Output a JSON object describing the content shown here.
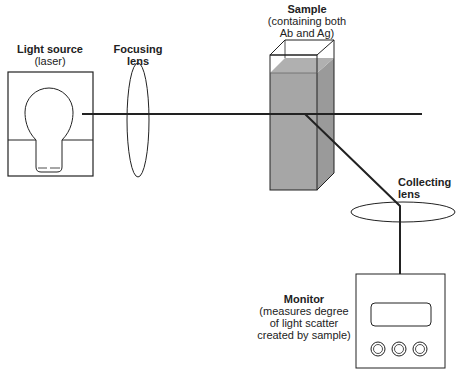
{
  "diagram": {
    "type": "light-scatter-nephelometry-setup",
    "labels": {
      "light_source": {
        "title": "Light source",
        "subtitle": "(laser)"
      },
      "focusing_lens": {
        "title": "Focusing",
        "title2": "lens"
      },
      "sample": {
        "title": "Sample",
        "sub1": "(containing both",
        "sub2": "Ab and Ag)"
      },
      "collecting_lens": {
        "title": "Collecting",
        "title2": "lens"
      },
      "monitor": {
        "title": "Monitor",
        "sub1": "(measures degree",
        "sub2": "of light scatter",
        "sub3": "created by sample)"
      }
    },
    "colors": {
      "line": "#222222",
      "sample_fill": "#a6a6a6",
      "sample_side_fill": "#9a9a9a",
      "background": "#ffffff"
    },
    "monitor_knobs": 3
  }
}
